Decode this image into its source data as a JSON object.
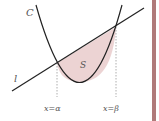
{
  "diagram": {
    "curve_label": "C",
    "line_label": "l",
    "region_label": "S",
    "alpha_label": "x=α",
    "beta_label": "x=β",
    "colors": {
      "stroke": "#222222",
      "region_fill": "#ecd3d3",
      "dashed": "#999999",
      "label": "#555555",
      "side_bar": "#b07a7a"
    }
  }
}
